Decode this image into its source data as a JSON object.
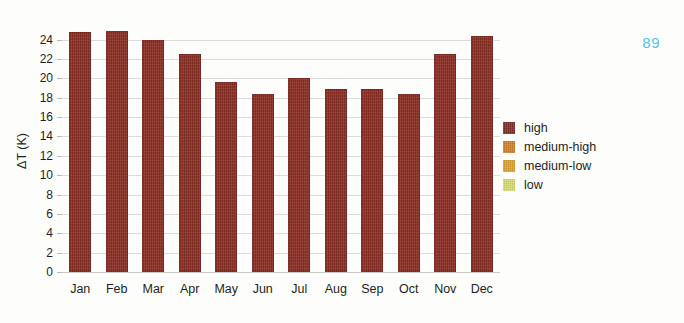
{
  "page": {
    "number": "89",
    "number_color": "#5bc0ea",
    "background": "#fdfdfc"
  },
  "chart_data": {
    "type": "bar",
    "title": "",
    "xlabel": "",
    "ylabel": "ΔT (K)",
    "categories": [
      "Jan",
      "Feb",
      "Mar",
      "Apr",
      "May",
      "Jun",
      "Jul",
      "Aug",
      "Sep",
      "Oct",
      "Nov",
      "Dec"
    ],
    "series": [
      {
        "name": "high",
        "color": "#8c2f25",
        "values": [
          24.8,
          24.9,
          24.0,
          22.5,
          19.6,
          18.4,
          20.0,
          18.9,
          18.9,
          18.4,
          22.5,
          24.4
        ]
      }
    ],
    "ylim": [
      0,
      25
    ],
    "yticks": [
      0,
      2,
      4,
      6,
      8,
      10,
      12,
      14,
      16,
      18,
      20,
      22,
      24
    ],
    "ytick_labels": [
      "0",
      "2",
      "4",
      "6",
      "8",
      "10",
      "12",
      "14",
      "16",
      "18",
      "20",
      "22",
      "24"
    ],
    "grid": true,
    "grid_color": "#dcdcdc",
    "legend_position": "right",
    "legend": [
      {
        "label": "high",
        "color": "#7e3028"
      },
      {
        "label": "medium-high",
        "color": "#d4812a"
      },
      {
        "label": "medium-low",
        "color": "#e0a32e"
      },
      {
        "label": "low",
        "color": "#d8de72"
      }
    ]
  }
}
